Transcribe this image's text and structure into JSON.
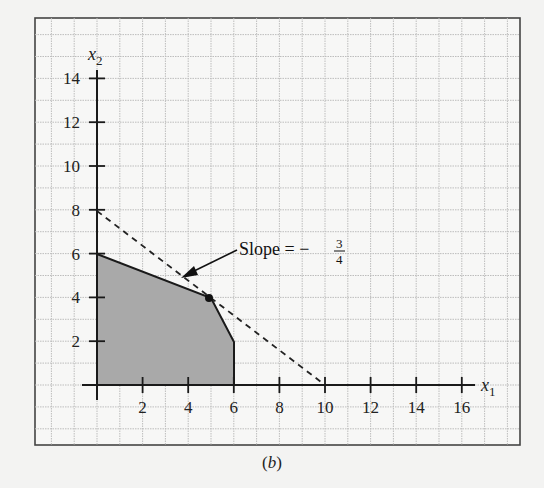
{
  "chart_data": {
    "type": "line",
    "title": "",
    "caption": "(b)",
    "xlabel": "x1",
    "ylabel": "x2",
    "xlim": [
      0,
      17
    ],
    "ylim": [
      0,
      15
    ],
    "x_ticks": [
      2,
      4,
      6,
      8,
      10,
      12,
      14,
      16
    ],
    "y_ticks": [
      2,
      4,
      6,
      8,
      10,
      12,
      14
    ],
    "grid": true,
    "feasible_region": {
      "vertices": [
        [
          0,
          0
        ],
        [
          0,
          6
        ],
        [
          5,
          4
        ],
        [
          6,
          2
        ],
        [
          6,
          0
        ]
      ],
      "fill": "#a8a8a8"
    },
    "objective_line": {
      "style": "dashed",
      "points": [
        [
          0,
          8
        ],
        [
          10,
          0
        ]
      ],
      "slope": "-3/4"
    },
    "optimal_point": [
      5,
      4
    ],
    "annotation": {
      "text": "Slope = −",
      "fraction_num": "3",
      "fraction_den": "4",
      "arrow_to": [
        4,
        5
      ]
    }
  },
  "labels": {
    "x_axis": "x",
    "x_sub": "1",
    "y_axis": "x",
    "y_sub": "2",
    "caption_open": "(",
    "caption_letter": "b",
    "caption_close": ")",
    "slope_text": "Slope = −",
    "slope_num": "3",
    "slope_den": "4",
    "xt": [
      "2",
      "4",
      "6",
      "8",
      "10",
      "12",
      "14",
      "16"
    ],
    "yt": [
      "2",
      "4",
      "6",
      "8",
      "10",
      "12",
      "14"
    ]
  },
  "colors": {
    "axis": "#1a1a1a",
    "grid": "#bdbdbd",
    "frame": "#444444",
    "fill": "#a9a9a9"
  }
}
